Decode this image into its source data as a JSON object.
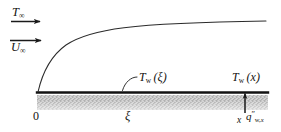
{
  "figure": {
    "background_color": "#ffffff",
    "line_color": "#1a1a1a",
    "hatch_color": "#9a9a9a",
    "width": 281,
    "height": 132
  },
  "labels": {
    "free_stream_temperature": {
      "symbol": "T",
      "subscript": "∞",
      "arrow": "arrow-right"
    },
    "free_stream_velocity": {
      "symbol": "U",
      "subscript": "∞",
      "arrow": "arrow-right"
    },
    "origin": "0",
    "xi": "ξ",
    "wall_temperature_xi": {
      "symbol": "T",
      "subscript": "w",
      "argument": "(ξ)"
    },
    "wall_temperature_x": {
      "symbol": "T",
      "subscript": "w",
      "argument": "(x)"
    },
    "x_tick": "x",
    "wall_heat_flux": {
      "symbol": "q",
      "prime": "″",
      "subscript_w": "w,",
      "subscript_x": "x"
    }
  },
  "geometry": {
    "baseline_y": 92,
    "baseline_x_start": 37,
    "baseline_x_end": 268,
    "hatch_top": 95,
    "hatch_bottom": 110,
    "curve_start": [
      38,
      92
    ],
    "curve_end": [
      266,
      21
    ],
    "heat_flux_arrow_x": 245,
    "heat_flux_arrow_top": 94,
    "heat_flux_arrow_bottom": 113,
    "leader_tip": [
      122,
      90
    ],
    "leader_start": [
      137,
      77
    ]
  }
}
